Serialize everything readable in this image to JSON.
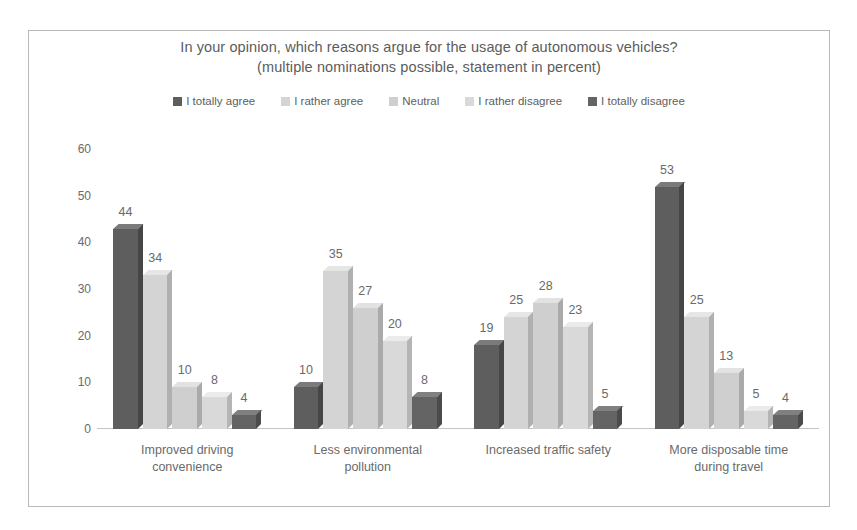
{
  "chart_data": {
    "type": "bar",
    "title": "In your opinion, which reasons argue for the usage of autonomous vehicles?",
    "subtitle": "(multiple nominations possible, statement in percent)",
    "xlabel": "",
    "ylabel": "",
    "ylim": [
      0,
      60
    ],
    "yticks": [
      60,
      50,
      40,
      30,
      20,
      10,
      0
    ],
    "grid": false,
    "legend_position": "top",
    "categories": [
      "Improved driving convenience",
      "Less environmental pollution",
      "Increased traffic safety",
      "More disposable time during travel"
    ],
    "category_lines": [
      [
        "Improved driving",
        "convenience"
      ],
      [
        "Less environmental",
        "pollution"
      ],
      [
        "Increased traffic safety",
        ""
      ],
      [
        "More disposable time",
        "during travel"
      ]
    ],
    "series": [
      {
        "name": "I totally agree",
        "color": "#5e5e5e",
        "top_color": "#7b7b7b",
        "side_color": "#464646",
        "values": [
          44,
          10,
          19,
          53
        ]
      },
      {
        "name": "I rather agree",
        "color": "#d4d4d4",
        "top_color": "#e6e6e6",
        "side_color": "#b0b0b0",
        "values": [
          34,
          35,
          25,
          25
        ]
      },
      {
        "name": "Neutral",
        "color": "#cfcfcf",
        "top_color": "#e2e2e2",
        "side_color": "#aaaaaa",
        "values": [
          10,
          27,
          28,
          13
        ]
      },
      {
        "name": "I rather disagree",
        "color": "#d9d9d9",
        "top_color": "#ebebeb",
        "side_color": "#b5b5b5",
        "values": [
          8,
          20,
          23,
          5
        ]
      },
      {
        "name": "I totally disagree",
        "color": "#646464",
        "top_color": "#808080",
        "side_color": "#4b4b4b",
        "values": [
          4,
          8,
          5,
          4
        ]
      }
    ]
  },
  "colors": {
    "frame_border": "#b9b9b9",
    "axis_line": "#c4c4c4",
    "text": "#6a6a6a"
  }
}
